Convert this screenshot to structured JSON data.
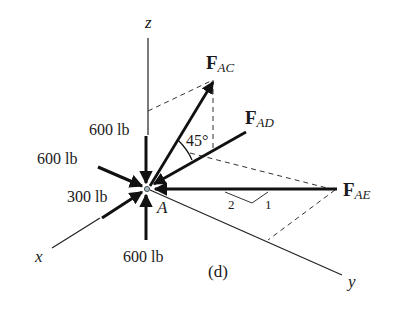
{
  "figure": {
    "caption": "(d)",
    "axes": {
      "x": "x",
      "y": "y",
      "z": "z"
    },
    "point": "A",
    "angle_label": "45°",
    "slope": {
      "run": "2",
      "rise": "1"
    },
    "forces": {
      "fac": {
        "main": "F",
        "sub": "AC"
      },
      "fad": {
        "main": "F",
        "sub": "AD"
      },
      "fae": {
        "main": "F",
        "sub": "AE"
      },
      "top_load": "600 lb",
      "upper_left_load": "600 lb",
      "left_load": "300 lb",
      "bottom_load": "600 lb"
    }
  }
}
